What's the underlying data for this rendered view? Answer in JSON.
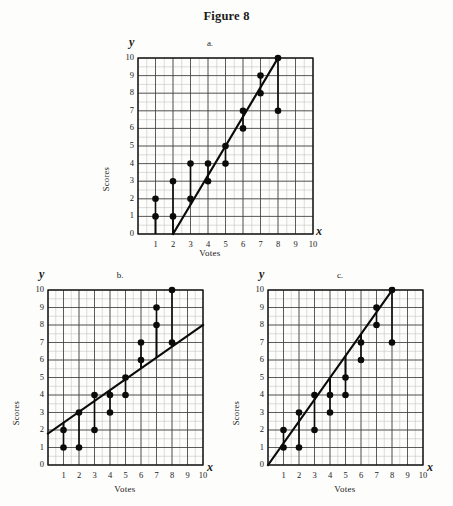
{
  "figure": {
    "title": "Figure 8"
  },
  "axis_letters": {
    "y": "y",
    "x": "x"
  },
  "labels": {
    "xlabel": "Votes",
    "ylabel": "Scores"
  },
  "ticks": {
    "y": [
      "0",
      "1",
      "2",
      "3",
      "4",
      "5",
      "6",
      "7",
      "8",
      "9",
      "10"
    ],
    "x": [
      "1",
      "2",
      "3",
      "4",
      "5",
      "6",
      "7",
      "8",
      "9",
      "10"
    ]
  },
  "panel_letters": {
    "a": "a.",
    "b": "b.",
    "c": "c."
  },
  "colors": {
    "ink": "#0b0b0b",
    "grid_minor": "#b9b9b9",
    "grid_major": "#3b3b3b",
    "background": "#fdfdfb"
  },
  "chart_data": [
    {
      "type": "scatter",
      "id": "a",
      "title": "a.",
      "xlabel": "Votes",
      "ylabel": "Scores",
      "xlim": [
        0,
        10
      ],
      "ylim": [
        0,
        10
      ],
      "grid": true,
      "grid_minor_step": 0.5,
      "grid_major_step": 1,
      "legend": "none",
      "x": [
        1,
        1,
        2,
        2,
        3,
        3,
        4,
        4,
        5,
        5,
        6,
        6,
        7,
        7,
        8,
        8
      ],
      "y": [
        1,
        2,
        1,
        3,
        2,
        4,
        3,
        4,
        4,
        5,
        6,
        7,
        8,
        9,
        7,
        10
      ],
      "fit_line": {
        "x1": 2,
        "y1": 0,
        "x2": 8,
        "y2": 10,
        "slope": 1.667,
        "intercept": -3.333
      },
      "residual_stems": true
    },
    {
      "type": "scatter",
      "id": "b",
      "title": "b.",
      "xlabel": "Votes",
      "ylabel": "Scores",
      "xlim": [
        0,
        10
      ],
      "ylim": [
        0,
        10
      ],
      "grid": true,
      "grid_minor_step": 0.5,
      "grid_major_step": 1,
      "legend": "none",
      "x": [
        1,
        1,
        2,
        2,
        3,
        3,
        4,
        4,
        5,
        5,
        6,
        6,
        7,
        7,
        8,
        8
      ],
      "y": [
        1,
        2,
        1,
        3,
        2,
        4,
        3,
        4,
        4,
        5,
        6,
        7,
        8,
        9,
        7,
        10
      ],
      "fit_line": {
        "x1": 0,
        "y1": 1.8,
        "x2": 10,
        "y2": 8.0,
        "slope": 0.62,
        "intercept": 1.8
      },
      "residual_stems": true
    },
    {
      "type": "scatter",
      "id": "c",
      "title": "c.",
      "xlabel": "Votes",
      "ylabel": "Scores",
      "xlim": [
        0,
        10
      ],
      "ylim": [
        0,
        10
      ],
      "grid": true,
      "grid_minor_step": 0.5,
      "grid_major_step": 1,
      "legend": "none",
      "x": [
        1,
        1,
        2,
        2,
        3,
        3,
        4,
        4,
        5,
        5,
        6,
        6,
        7,
        7,
        8,
        8
      ],
      "y": [
        1,
        2,
        1,
        3,
        2,
        4,
        3,
        4,
        4,
        5,
        6,
        7,
        8,
        9,
        7,
        10
      ],
      "fit_line": {
        "x1": 0,
        "y1": 0,
        "x2": 8.1,
        "y2": 10.1,
        "slope": 1.25,
        "intercept": 0
      },
      "residual_stems": true
    }
  ]
}
